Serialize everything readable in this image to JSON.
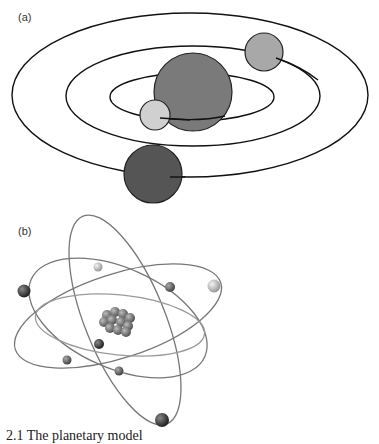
{
  "panel_a": {
    "label": "(a)",
    "title": "Planetary (solar system) model",
    "orbits": 3,
    "bodies": [
      "central-sun",
      "inner-planet",
      "middle-planet",
      "outer-planet"
    ]
  },
  "panel_b": {
    "label": "(b)",
    "title": "Atom model",
    "orbits": 4,
    "electrons": 9
  },
  "caption": "2.1 The planetary model"
}
